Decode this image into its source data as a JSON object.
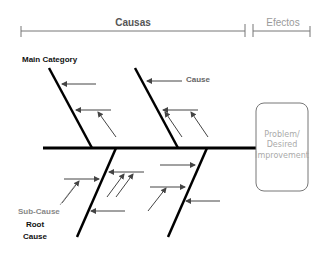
{
  "header": {
    "causes_label": "Causas",
    "effects_label": "Efectos"
  },
  "labels": {
    "main_category": "Main Category",
    "cause": "Cause",
    "sub_cause": "Sub-Cause",
    "root_cause_line1": "Root",
    "root_cause_line2": "Cause"
  },
  "effect_box": {
    "line1": "Problem/",
    "line2": "Desired",
    "line3": "Improvement"
  },
  "colors": {
    "header_causes": "#555555",
    "header_effects": "#9a9a9a",
    "line": "#000000",
    "arrow": "#555555",
    "sub_cause": "#888888",
    "box_border": "#777777",
    "box_text": "#aaaaaa"
  }
}
